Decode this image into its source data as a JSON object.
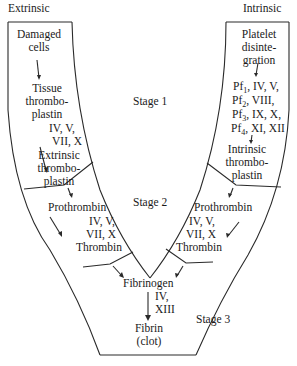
{
  "diagram": {
    "type": "blood-coagulation-pathway",
    "headers": {
      "extrinsic": "Extrinsic",
      "intrinsic": "Intrinsic"
    },
    "stages": {
      "stage1": "Stage 1",
      "stage2": "Stage 2",
      "stage3": "Stage 3"
    },
    "extrinsic_path": {
      "start_line1": "Damaged",
      "start_line2": "cells",
      "tissue_line1": "Tissue",
      "tissue_line2": "thrombo-",
      "tissue_line3": "plastin",
      "factors_line1": "IV, V,",
      "factors_line2": "VII, X",
      "ext_line1": "Extrinsic",
      "ext_line2": "thrombo-",
      "ext_line3": "plastin",
      "prothrombin": "Prothrombin",
      "s2_factors_line1": "IV, V,",
      "s2_factors_line2": "VII, X",
      "thrombin": "Thrombin"
    },
    "intrinsic_path": {
      "start_line1": "Platelet",
      "start_line2": "disinte-",
      "start_line3": "gration",
      "pf1": "Pf",
      "pf1_sub": "1",
      "pf1_rest": ",  IV, V,",
      "pf2": "Pf",
      "pf2_sub": "2",
      "pf2_rest": ",  VIII,",
      "pf3": "Pf",
      "pf3_sub": "3",
      "pf3_rest": ",  IX, X,",
      "pf4": "Pf",
      "pf4_sub": "4",
      "pf4_rest": ",  XI, XII",
      "int_line1": "Intrinsic",
      "int_line2": "thrombo-",
      "int_line3": "plastin",
      "prothrombin": "Prothrombin",
      "s2_factors_line1": "IV, V,",
      "s2_factors_line2": "VII, X",
      "thrombin": "Thrombin"
    },
    "common_path": {
      "fibrinogen": "Fibrinogen",
      "factors_line1": "IV,",
      "factors_line2": "XIII",
      "fibrin": "Fibrin",
      "fibrin_note": "(clot)"
    },
    "colors": {
      "line": "#2a2a2a",
      "text": "#1a1a1a",
      "background": "#ffffff"
    }
  }
}
